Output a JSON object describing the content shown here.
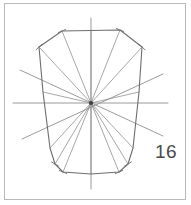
{
  "figure": {
    "label": "16",
    "label_color": "#4a4a4a",
    "frame_color": "#b9b9b9",
    "background_color": "#ffffff",
    "outline_color": "#6e6e6e",
    "spoke_color": "#8a8a8a",
    "axis_color": "#8f8f8f",
    "hub_color": "#404040",
    "center": {
      "x": 91,
      "y": 103
    },
    "axes": [
      {
        "name": "vertical-axis",
        "x1": 91,
        "y1": 18,
        "x2": 91,
        "y2": 189
      },
      {
        "name": "horizontal-axis",
        "x1": 13,
        "y1": 103,
        "x2": 168,
        "y2": 103
      },
      {
        "name": "diagonal-axis-ne-sw",
        "x1": 20,
        "y1": 70,
        "x2": 163,
        "y2": 136
      },
      {
        "name": "diagonal-axis-nw-se",
        "x1": 163,
        "y1": 74,
        "x2": 22,
        "y2": 139
      }
    ],
    "outline_points": [
      {
        "x": 62,
        "y": 31
      },
      {
        "x": 120,
        "y": 30
      },
      {
        "x": 142,
        "y": 47
      },
      {
        "x": 139,
        "y": 92
      },
      {
        "x": 133,
        "y": 148
      },
      {
        "x": 128,
        "y": 164
      },
      {
        "x": 119,
        "y": 172
      },
      {
        "x": 91,
        "y": 174
      },
      {
        "x": 63,
        "y": 172
      },
      {
        "x": 55,
        "y": 164
      },
      {
        "x": 50,
        "y": 148
      },
      {
        "x": 43,
        "y": 92
      },
      {
        "x": 39,
        "y": 47
      }
    ],
    "spoke_endpoints": [
      {
        "x": 62,
        "y": 31
      },
      {
        "x": 120,
        "y": 30
      },
      {
        "x": 142,
        "y": 47
      },
      {
        "x": 139,
        "y": 92
      },
      {
        "x": 133,
        "y": 148
      },
      {
        "x": 128,
        "y": 164
      },
      {
        "x": 119,
        "y": 172
      },
      {
        "x": 91,
        "y": 174
      },
      {
        "x": 63,
        "y": 172
      },
      {
        "x": 55,
        "y": 164
      },
      {
        "x": 50,
        "y": 148
      },
      {
        "x": 43,
        "y": 92
      },
      {
        "x": 39,
        "y": 47
      },
      {
        "x": 91,
        "y": 30
      }
    ],
    "vertex_ticks": [
      {
        "x": 62,
        "y": 31
      },
      {
        "x": 120,
        "y": 30
      },
      {
        "x": 142,
        "y": 47
      },
      {
        "x": 39,
        "y": 47
      },
      {
        "x": 55,
        "y": 164
      },
      {
        "x": 128,
        "y": 164
      },
      {
        "x": 63,
        "y": 172
      },
      {
        "x": 119,
        "y": 172
      }
    ]
  }
}
